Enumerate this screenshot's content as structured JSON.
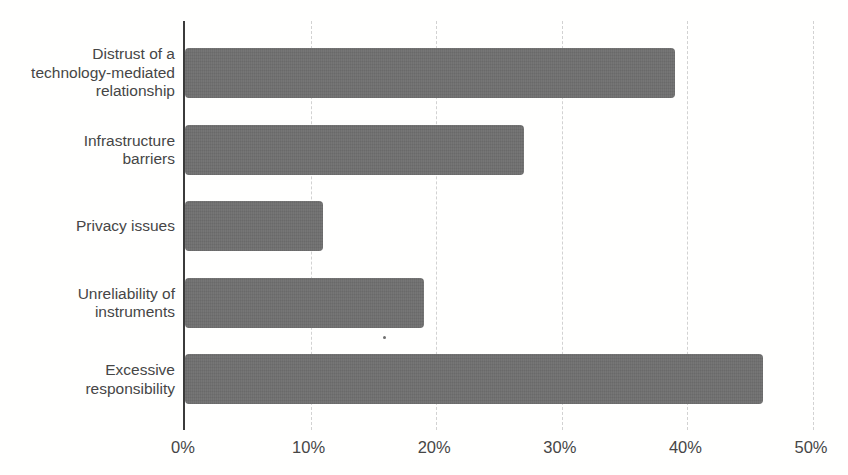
{
  "chart_data": {
    "type": "bar",
    "orientation": "horizontal",
    "title": "",
    "xlabel": "",
    "ylabel": "",
    "categories": [
      "Distrust of a technology-mediated relationship",
      "Infrastructure barriers",
      "Privacy issues",
      "Unreliability of instruments",
      "Excessive responsibility"
    ],
    "category_lines": [
      [
        "Distrust of a",
        "technology-mediated",
        "relationship"
      ],
      [
        "Infrastructure",
        "barriers"
      ],
      [
        "Privacy issues"
      ],
      [
        "Unreliability of",
        "instruments"
      ],
      [
        "Excessive",
        "responsibility"
      ]
    ],
    "values": [
      39,
      27,
      11,
      19,
      46
    ],
    "unit": "%",
    "xlim": [
      0,
      50
    ],
    "x_ticks": [
      "0%",
      "10%",
      "20%",
      "30%",
      "40%",
      "50%"
    ],
    "x_tick_values": [
      0,
      10,
      20,
      30,
      40,
      50
    ],
    "grid": "vertical-dashed",
    "legend": "none",
    "colors": {
      "bar": "#6f6f6f",
      "axis_line": "#3b3b3b",
      "gridline": "#d2d2d2",
      "text": "#464646",
      "background": "#ffffff"
    }
  }
}
